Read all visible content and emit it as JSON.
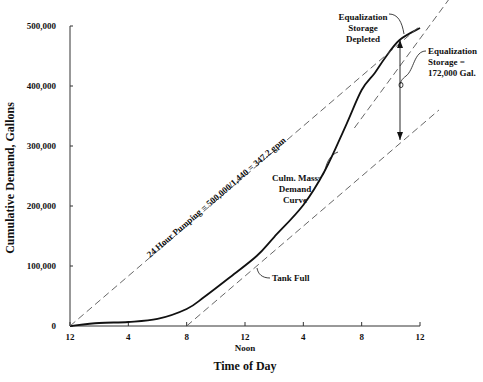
{
  "chart_data": {
    "type": "line",
    "title": "",
    "xlabel": "Time of Day",
    "ylabel": "Cumulative Demand, Gallons",
    "x_ticks": [
      "12",
      "4",
      "8",
      "12",
      "4",
      "8",
      "12"
    ],
    "x_tick_hours": [
      0,
      4,
      8,
      12,
      16,
      20,
      24
    ],
    "x_sublabel": {
      "at_hour": 12,
      "text": "Noon"
    },
    "y_ticks": [
      "0",
      "100,000",
      "200,000",
      "300,000",
      "400,000",
      "500,000"
    ],
    "y_tick_values": [
      0,
      100000,
      200000,
      300000,
      400000,
      500000
    ],
    "xlim": [
      0,
      24
    ],
    "ylim": [
      0,
      500000
    ],
    "grid": false,
    "series": [
      {
        "name": "Culm. Mass Demand Curve",
        "style": "solid",
        "x": [
          0,
          2,
          4,
          6,
          8,
          9.2,
          10.9,
          12.8,
          14,
          16,
          17.5,
          18.9,
          20,
          20.9,
          21.6,
          22.6,
          24
        ],
        "values": [
          0,
          5000,
          6700,
          11700,
          28300,
          48300,
          80000,
          116700,
          148300,
          201700,
          260000,
          333300,
          393300,
          421700,
          446700,
          476700,
          496700
        ]
      },
      {
        "name": "24 Hour Pumping = 500,000/1,440 = 347.2 gpm",
        "style": "dashed",
        "x": [
          0,
          24
        ],
        "values": [
          0,
          500000
        ]
      },
      {
        "name": "Tangent at Tank Full",
        "style": "dashed",
        "x": [
          8,
          25.3
        ],
        "values": [
          0,
          360000
        ]
      },
      {
        "name": "Tangent at Equalization Storage Depleted",
        "style": "dashed",
        "x": [
          19.5,
          26
        ],
        "values": [
          330000,
          545000
        ]
      }
    ],
    "annotations": [
      {
        "text": "Equalization Storage Depleted",
        "x": 22.6,
        "y": 476700
      },
      {
        "text": "Equalization Storage = 172,000 Gal.",
        "x": 22.6,
        "y": 400000
      },
      {
        "text": "Culm. Mass Demand Curve",
        "x": 18.9,
        "y": 333300
      },
      {
        "text": "Tank Full",
        "x": 13,
        "y": 120000
      },
      {
        "text": "24 Hour Pumping = 500,000/1,440 = 347.2 gpm",
        "x": 12,
        "y": 250000
      }
    ]
  },
  "labels": {
    "xlabel": "Time of Day",
    "ylabel": "Cumulative Demand, Gallons",
    "noon": "Noon",
    "pumping": "24 Hour Pumping = 500,000/1,440 = 347.2 gpm",
    "depleted": [
      "Equalization",
      "Storage",
      "Depleted"
    ],
    "storage": [
      "Equalization",
      "Storage =",
      "172,000 Gal."
    ],
    "culm": [
      "Culm. Mass",
      "Demand",
      "Curve"
    ],
    "tank_full": "Tank Full"
  },
  "colors": {
    "line": "#111111",
    "dash": "#555555",
    "axis": "#333333"
  }
}
